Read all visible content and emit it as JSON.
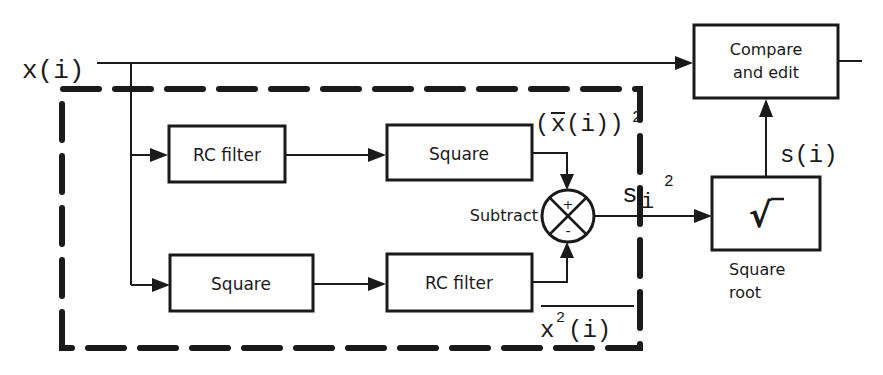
{
  "diagram": {
    "input_label": "x(i)",
    "blocks": {
      "rc_filter_top": "RC filter",
      "square_top": "Square",
      "square_bottom": "Square",
      "rc_filter_bottom": "RC filter",
      "compare_edit_line1": "Compare",
      "compare_edit_line2": "and edit",
      "sqrt_symbol": "√",
      "square_root_caption_line1": "Square",
      "square_root_caption_line2": "root"
    },
    "summing_junction": {
      "label": "Subtract",
      "plus_sign": "+",
      "minus_sign": "-"
    },
    "signals": {
      "mean_squared_open": "(",
      "mean_squared_x": "x",
      "mean_squared_rest": "(i))",
      "mean_squared_exp": "2",
      "mean_of_square_x": "x",
      "mean_of_square_exp": "2",
      "mean_of_square_rest": "(i)",
      "variance_base": "s",
      "variance_sub": "i",
      "variance_exp": "2",
      "std_dev": "s(i)"
    }
  }
}
